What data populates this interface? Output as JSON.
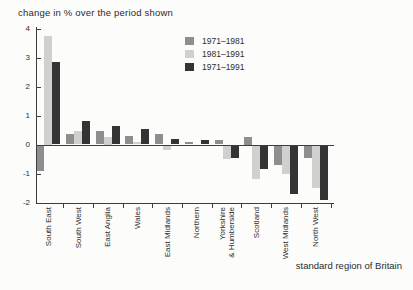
{
  "chart_data": {
    "type": "bar",
    "title": "change in % over the period shown",
    "xlabel": "standard region of Britain",
    "ylabel": "",
    "ylim": [
      -2,
      4
    ],
    "yticks": [
      4,
      3,
      2,
      1,
      0,
      -1,
      -2
    ],
    "grid": false,
    "legend_position": "top-right-inside",
    "categories": [
      "South East",
      "South West",
      "East Anglia",
      "Wales",
      "East Midlands",
      "Northern",
      "Yorkshire\n& Humberside",
      "Scotland",
      "West Midlands",
      "North West"
    ],
    "series": [
      {
        "name": "1971–1981",
        "color": "#8e8e8e",
        "values": [
          -0.9,
          0.35,
          0.45,
          0.3,
          0.35,
          0.1,
          0.15,
          0.25,
          -0.7,
          -0.45
        ]
      },
      {
        "name": "1981–1991",
        "color": "#d0d0cf",
        "values": [
          3.75,
          0.45,
          0.25,
          0.1,
          -0.2,
          0.0,
          -0.5,
          -1.2,
          -1.0,
          -1.5
        ]
      },
      {
        "name": "1971–1991",
        "color": "#343434",
        "values": [
          2.85,
          0.8,
          0.65,
          0.55,
          0.2,
          0.15,
          -0.45,
          -0.85,
          -1.7,
          -1.9
        ]
      }
    ]
  },
  "colors": {
    "axis": "#3d3d3d",
    "text": "#2e2e2e",
    "background": "#fcfcfb"
  }
}
